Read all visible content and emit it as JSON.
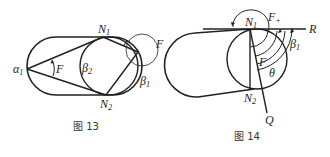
{
  "figures": [
    {
      "caption": "图 13",
      "labels": {
        "N1": "N",
        "N1_sub": "1",
        "N2": "N",
        "N2_sub": "2",
        "alpha1": "α",
        "alpha1_sub": "1",
        "beta2": "β",
        "beta2_sub": "2",
        "beta1": "β",
        "beta1_sub": "1",
        "F_inner": "F",
        "F_outer": "F"
      }
    },
    {
      "caption": "图 14",
      "labels": {
        "N1": "N",
        "N1_sub": "1",
        "N2": "N",
        "N2_sub": "2",
        "Fplus": "F",
        "Fplus_sub": "+",
        "F": "F",
        "theta": "θ",
        "beta1": "β",
        "beta1_sub": "1",
        "R": "R",
        "Q": "Q"
      }
    }
  ]
}
